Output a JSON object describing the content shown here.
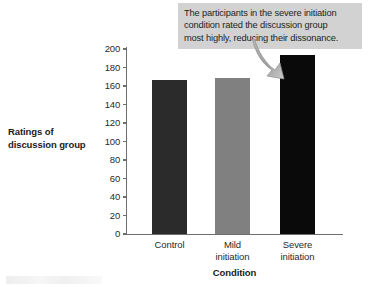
{
  "chart_data": {
    "type": "bar",
    "title": "",
    "xlabel": "Condition",
    "ylabel": "Ratings of discussion group",
    "categories": [
      "Control",
      "Mild initiation",
      "Severe initiation"
    ],
    "values": [
      166,
      169,
      193
    ],
    "ylim": [
      0,
      200
    ],
    "yticks": [
      0,
      20,
      40,
      60,
      80,
      100,
      120,
      140,
      160,
      180,
      200
    ],
    "ytick_labels": [
      "0",
      "20",
      "40",
      "60",
      "80",
      "100",
      "120",
      "140",
      "160",
      "180",
      "200"
    ],
    "grid": false,
    "legend": false,
    "bar_colors": [
      "#2b2b2b",
      "#808080",
      "#0a0a0a"
    ],
    "annotations": [
      {
        "text": "The participants in the severe initiation condition rated the discussion group most highly, reducing their dissonance.",
        "points_to": "Severe initiation"
      }
    ]
  },
  "y_axis": {
    "title_line_1": "Ratings of",
    "title_line_2": "discussion group"
  },
  "x_axis": {
    "title": "Condition",
    "labels": [
      {
        "line_1": "Control",
        "line_2": ""
      },
      {
        "line_1": "Mild",
        "line_2": "initiation"
      },
      {
        "line_1": "Severe",
        "line_2": "initiation"
      }
    ]
  },
  "callout": {
    "line_1": "The participants in the severe initiation",
    "line_2": "condition rated the discussion group",
    "line_3": "most highly, reducing their dissonance."
  },
  "colors": {
    "callout_background": "#d2d2d2",
    "axis": "#6e6e6e",
    "arrow": "#9a9a9a",
    "bar_control": "#2b2b2b",
    "bar_mild": "#808080",
    "bar_severe": "#0a0a0a"
  }
}
